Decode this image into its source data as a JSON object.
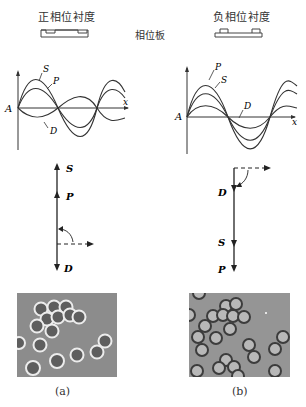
{
  "header": {
    "left_title": "正相位衬度",
    "right_title": "负相位衬度",
    "center_label": "相位板"
  },
  "waves": {
    "left": {
      "origin_label": "A",
      "axis_label": "x",
      "curve_labels": [
        "S",
        "P",
        "D"
      ]
    },
    "right": {
      "origin_label": "A",
      "axis_label": "x",
      "curve_labels": [
        "P",
        "S",
        "D"
      ]
    }
  },
  "vectors": {
    "left": {
      "labels": [
        "S",
        "P",
        "D"
      ]
    },
    "right": {
      "labels": [
        "D",
        "S",
        "P"
      ]
    }
  },
  "photos": {
    "left_caption": "(a)",
    "right_caption": "(b)"
  },
  "colors": {
    "line": "#2a2a2a",
    "photo_bg": "#8f8f8f",
    "cell_ring_bright": "#e8e8e8",
    "cell_ring_dark": "#3a3a3a"
  }
}
